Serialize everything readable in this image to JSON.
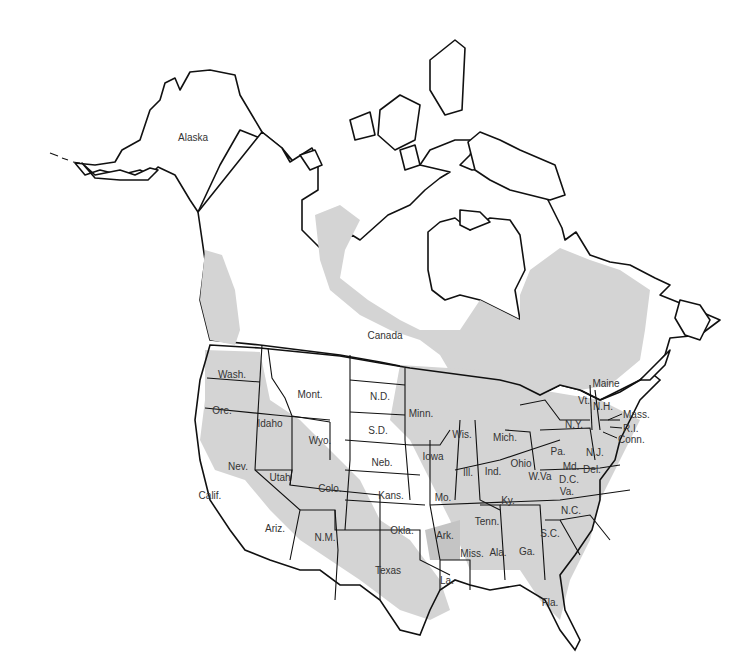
{
  "map": {
    "colors": {
      "land": "#ffffff",
      "shaded_region": "#d4d4d4",
      "outline": "#111111",
      "label_text": "#333333"
    },
    "regions": {
      "alaska": "Alaska",
      "canada": "Canada"
    },
    "states": {
      "wash": "Wash.",
      "ore": "Ore.",
      "calif": "Calif.",
      "idaho": "Idaho",
      "nev": "Nev.",
      "mont": "Mont.",
      "wyo": "Wyo.",
      "utah": "Utah",
      "colo": "Colo.",
      "ariz": "Ariz.",
      "nm": "N.M.",
      "nd": "N.D.",
      "sd": "S.D.",
      "neb": "Neb.",
      "kans": "Kans.",
      "okla": "Okla.",
      "texas": "Texas",
      "minn": "Minn.",
      "iowa": "Iowa",
      "mo": "Mo.",
      "ark": "Ark.",
      "la": "La.",
      "wis": "Wis.",
      "ill": "Ill.",
      "mich": "Mich.",
      "ind": "Ind.",
      "ohio": "Ohio",
      "ky": "Ky.",
      "tenn": "Tenn.",
      "miss": "Miss.",
      "ala": "Ala.",
      "ga": "Ga.",
      "fla": "Fla.",
      "sc": "S.C.",
      "nc": "N.C.",
      "va": "Va.",
      "wva": "W.Va",
      "pa": "Pa.",
      "ny": "N.Y.",
      "md": "Md.",
      "dc": "D.C.",
      "del": "Del.",
      "nj": "N.J.",
      "vt": "Vt.",
      "nh": "N.H.",
      "maine": "Maine",
      "mass": "Mass.",
      "ri": "R.I.",
      "conn": "Conn."
    }
  }
}
